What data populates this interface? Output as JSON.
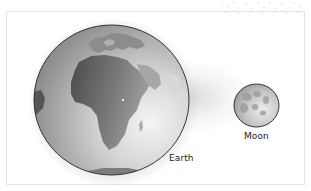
{
  "diagram": {
    "bodies": [
      {
        "name": "Earth",
        "label": "Earth",
        "icon": "earth-globe-icon",
        "relative_size": "large"
      },
      {
        "name": "Moon",
        "label": "Moon",
        "icon": "moon-icon",
        "relative_size": "small"
      }
    ]
  },
  "labels": {
    "earth": "Earth",
    "moon": "Moon"
  },
  "colors": {
    "background": "#ffffff",
    "frame_border": "#e4e4e4",
    "earth_ocean_light": "#ededed",
    "earth_ocean_dark": "#8e8e8e",
    "earth_land": "#6a6a6a",
    "moon_fill": "#c8c8c8",
    "outline": "#333333",
    "text": "#222222"
  }
}
